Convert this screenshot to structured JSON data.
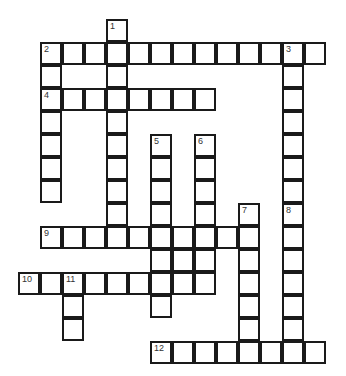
{
  "puzzle": {
    "type": "crossword",
    "origin_x": 41,
    "origin_y": 20,
    "cell_w": 22,
    "cell_h": 23,
    "line_color": "#1a1a1a",
    "entries": [
      {
        "number": "1",
        "direction": "down",
        "col": 3,
        "row": 0,
        "length": 10
      },
      {
        "number": "2",
        "direction": "across",
        "col": 0,
        "row": 1,
        "length": 13
      },
      {
        "number": "2",
        "direction": "down",
        "col": 0,
        "row": 1,
        "length": 7
      },
      {
        "number": "3",
        "direction": "down",
        "col": 11,
        "row": 1,
        "length": 14
      },
      {
        "number": "4",
        "direction": "across",
        "col": 0,
        "row": 3,
        "length": 8
      },
      {
        "number": "5",
        "direction": "down",
        "col": 5,
        "row": 5,
        "length": 8
      },
      {
        "number": "6",
        "direction": "down",
        "col": 7,
        "row": 5,
        "length": 7
      },
      {
        "number": "7",
        "direction": "down",
        "col": 9,
        "row": 8,
        "length": 7
      },
      {
        "number": "8",
        "direction": "down",
        "col": 11,
        "row": 8,
        "length": 7
      },
      {
        "number": "9",
        "direction": "across",
        "col": 0,
        "row": 9,
        "length": 10
      },
      {
        "number": "",
        "direction": "across",
        "col": 5,
        "row": 10,
        "length": 3
      },
      {
        "number": "10",
        "direction": "across",
        "col": -1,
        "row": 11,
        "length": 9
      },
      {
        "number": "11",
        "direction": "down",
        "col": 1,
        "row": 11,
        "length": 3
      },
      {
        "number": "12",
        "direction": "across",
        "col": 5,
        "row": 14,
        "length": 8
      }
    ]
  }
}
